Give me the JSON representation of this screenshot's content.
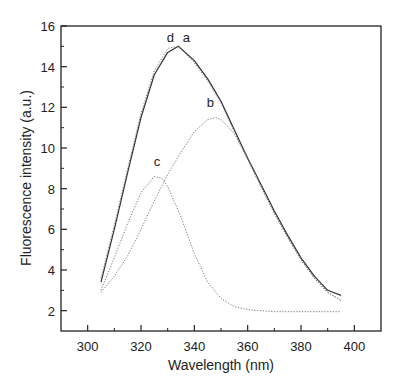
{
  "chart_data": {
    "type": "line",
    "title": "",
    "xlabel": "Wavelength (nm)",
    "ylabel": "Fluorescence intensity (a.u.)",
    "xlim": [
      290,
      410
    ],
    "ylim": [
      1,
      16
    ],
    "xticks": [
      300,
      320,
      340,
      360,
      380,
      400
    ],
    "xticks_minor": [
      310,
      330,
      350,
      370,
      390
    ],
    "yticks": [
      2,
      4,
      6,
      8,
      10,
      12,
      14,
      16
    ],
    "yticks_minor": [
      3,
      5,
      7,
      9,
      11,
      13,
      15
    ],
    "grid": false,
    "legend": "none (curves labeled inline)",
    "series": [
      {
        "name": "a",
        "style": "solid",
        "x": [
          305,
          310,
          315,
          320,
          325,
          330,
          334,
          340,
          345,
          350,
          355,
          360,
          365,
          370,
          375,
          380,
          385,
          390,
          395
        ],
        "values": [
          3.4,
          6.0,
          8.8,
          11.5,
          13.6,
          14.7,
          15.0,
          14.3,
          13.4,
          12.3,
          10.9,
          9.5,
          8.2,
          6.9,
          5.7,
          4.6,
          3.7,
          3.0,
          2.75
        ]
      },
      {
        "name": "d",
        "style": "dotted",
        "x": [
          305,
          310,
          315,
          320,
          325,
          330,
          334,
          340,
          345,
          350,
          355,
          360,
          365,
          370,
          375,
          380,
          385,
          390,
          395
        ],
        "values": [
          3.6,
          6.2,
          9.0,
          11.7,
          13.8,
          14.9,
          15.0,
          14.2,
          13.3,
          12.2,
          10.8,
          9.4,
          8.1,
          6.8,
          5.6,
          4.5,
          3.6,
          2.9,
          2.5
        ]
      },
      {
        "name": "b",
        "style": "dotted",
        "x": [
          305,
          310,
          315,
          320,
          325,
          330,
          335,
          340,
          345,
          348,
          350,
          355,
          360,
          365,
          370,
          375,
          380,
          385,
          390,
          395
        ],
        "values": [
          2.9,
          3.7,
          4.7,
          6.0,
          7.4,
          8.7,
          9.8,
          10.8,
          11.4,
          11.5,
          11.4,
          10.7,
          9.5,
          8.1,
          6.8,
          5.6,
          4.5,
          3.6,
          2.9,
          2.5
        ]
      },
      {
        "name": "c",
        "style": "dotted",
        "x": [
          305,
          310,
          315,
          320,
          325,
          328,
          330,
          335,
          340,
          345,
          350,
          355,
          360,
          365,
          370,
          380,
          390,
          395
        ],
        "values": [
          3.0,
          4.6,
          6.3,
          7.8,
          8.6,
          8.5,
          8.1,
          6.6,
          4.8,
          3.4,
          2.6,
          2.2,
          2.05,
          2.0,
          1.95,
          1.95,
          1.95,
          1.95
        ]
      }
    ],
    "annotations": [
      {
        "text": "a",
        "x": 337,
        "y": 15.2
      },
      {
        "text": "d",
        "x": 331,
        "y": 15.2
      },
      {
        "text": "b",
        "x": 346,
        "y": 12.0
      },
      {
        "text": "c",
        "x": 326,
        "y": 9.1
      }
    ]
  }
}
